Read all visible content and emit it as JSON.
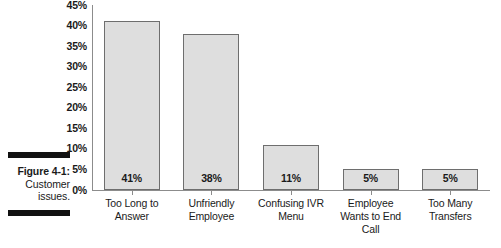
{
  "figure": {
    "caption_label": "Figure 4-1:",
    "caption_line2": "Customer",
    "caption_line3": "issues."
  },
  "colors": {
    "bar_fill": "#dedede",
    "bar_border": "#6e6e6e",
    "axis": "#8c8c8c",
    "text": "#1a1a1a",
    "rule": "#111111"
  },
  "chart_data": {
    "type": "bar",
    "title": "",
    "subtitle": "",
    "xlabel": "",
    "ylabel": "",
    "categories": [
      "Too Long to Answer",
      "Unfriendly Employee",
      "Confusing IVR Menu",
      "Employee Wants to End Call",
      "Too Many Transfers"
    ],
    "category_lines": [
      [
        "Too Long to",
        "Answer"
      ],
      [
        "Unfriendly",
        "Employee"
      ],
      [
        "Confusing IVR",
        "Menu"
      ],
      [
        "Employee",
        "Wants to End",
        "Call"
      ],
      [
        "Too Many",
        "Transfers"
      ]
    ],
    "values": [
      41,
      38,
      11,
      5,
      5
    ],
    "value_labels": [
      "41%",
      "38%",
      "11%",
      "5%",
      "5%"
    ],
    "ylim": [
      0,
      45
    ],
    "ytick_step": 5,
    "ytick_labels": [
      "45%",
      "40%",
      "35%",
      "30%",
      "25%",
      "20%",
      "15%",
      "10%",
      "5%",
      "0%"
    ],
    "ytick_values": [
      45,
      40,
      35,
      30,
      25,
      20,
      15,
      10,
      5,
      0
    ],
    "grid": false,
    "legend": false,
    "legend_position": "none"
  }
}
